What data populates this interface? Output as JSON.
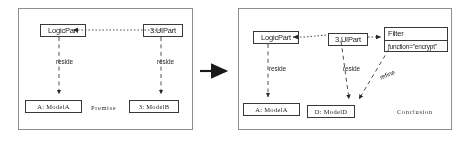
{
  "diagram": {
    "colors": {
      "panel_border": "#8d8d8d",
      "node_border": "#3c3c3c",
      "line": "#3a3a3a",
      "text": "#1a1a1a",
      "background": "#ffffff"
    },
    "panels": [
      {
        "id": "premise",
        "region_label": "Premise",
        "nodes": [
          {
            "id": "logicpart_p",
            "label": "LogicPart",
            "kind": "class"
          },
          {
            "id": "uipart_p",
            "label": "3.UIPart",
            "kind": "class"
          },
          {
            "id": "modela_p",
            "label": "A: ModelA",
            "kind": "instance"
          },
          {
            "id": "modelb_p",
            "label": "3: ModelB",
            "kind": "instance"
          }
        ],
        "edges": [
          {
            "from": "uipart_p",
            "to": "logicpart_p",
            "label": "",
            "style": "dotted-arrow"
          },
          {
            "from": "logicpart_p",
            "to": "modela_p",
            "label": "reside",
            "style": "dashed-arrow"
          },
          {
            "from": "uipart_p",
            "to": "modelb_p",
            "label": "reside",
            "style": "dashed-arrow"
          }
        ]
      },
      {
        "id": "conclusion",
        "region_label": "Conclusion",
        "nodes": [
          {
            "id": "logicpart_c",
            "label": "LogicPart",
            "kind": "class"
          },
          {
            "id": "uipart_c",
            "label": "3.UIPart",
            "kind": "class"
          },
          {
            "id": "filter_c",
            "label": "Filter",
            "attribute": "function=\"encrypt\"",
            "kind": "class-with-attribute"
          },
          {
            "id": "modela_c",
            "label": "A: ModelA",
            "kind": "instance"
          },
          {
            "id": "modeld_c",
            "label": "D: ModelD",
            "kind": "instance"
          }
        ],
        "edges": [
          {
            "from": "uipart_c",
            "to": "logicpart_c",
            "label": "",
            "style": "dotted-arrow"
          },
          {
            "from": "uipart_c",
            "to": "filter_c",
            "label": "",
            "style": "dotted-arrow"
          },
          {
            "from": "logicpart_c",
            "to": "modela_c",
            "label": "reside",
            "style": "dashed-arrow"
          },
          {
            "from": "uipart_c",
            "to": "modeld_c",
            "label": "reside",
            "style": "dashed-arrow"
          },
          {
            "from": "filter_c",
            "to": "modeld_c",
            "label": "refine",
            "style": "dashed-arrow"
          }
        ]
      }
    ],
    "transform_arrow": {
      "name": "implies-arrow",
      "direction": "right"
    }
  }
}
